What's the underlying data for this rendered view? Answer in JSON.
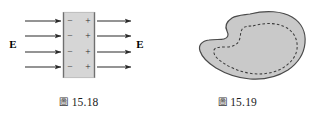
{
  "page": {
    "background_color": "#ffffff",
    "width": 317,
    "height": 122
  },
  "figures": [
    {
      "id": "figure-15-18",
      "caption_prefix": "圖",
      "caption_number": "15.18",
      "caption_full": "圖 15.18",
      "description": "Dielectric slab in a uniform electric field with induced surface charges",
      "slab": {
        "fill_color": "#d6d6d6",
        "edge_color": "#6f6f6f",
        "left_face_signs": [
          "−",
          "−",
          "−",
          "−"
        ],
        "right_face_signs": [
          "+",
          "+",
          "+",
          "+"
        ],
        "sign_color": "#2a2a2a",
        "rows": 4
      },
      "field": {
        "label_left": "E",
        "label_right": "E",
        "label_color": "#000000",
        "arrow_color": "#2b2b2b",
        "incoming_arrow_count": 4,
        "outgoing_arrow_count": 4,
        "direction": "left-to-right"
      }
    },
    {
      "id": "figure-15-19",
      "caption_prefix": "圖",
      "caption_number": "15.19",
      "caption_full": "圖 15.19",
      "description": "Irregular conductor body with a dashed interior closed surface",
      "blob": {
        "fill_color": "#c9c9c9",
        "outline_color": "#4a4a4a",
        "inner_contour_style": "dashed",
        "inner_contour_color": "#3b3b3b"
      }
    }
  ]
}
